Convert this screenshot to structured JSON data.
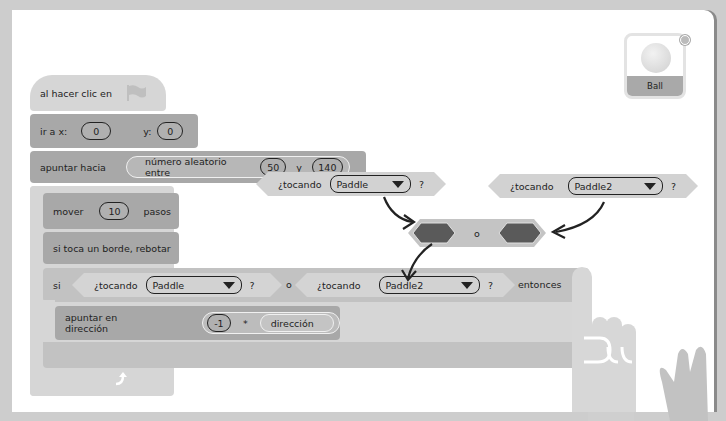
{
  "colors": {
    "panel_bg": "#ffffff",
    "frame_bg": "#cdcdcd",
    "motion_block": "#a8a8a8",
    "control_block": "#d6d6d6",
    "sensing_block": "#c9c9c9",
    "operator_slot": "#555555",
    "arrow": "#222222"
  },
  "script": {
    "hat": {
      "label": "al hacer clic en",
      "icon": "green-flag-icon"
    },
    "goto": {
      "label": "ir a x:",
      "x_value": "0",
      "y_label": "y:",
      "y_value": "0"
    },
    "point_towards": {
      "label": "apuntar hacia",
      "reporter_label": "número aleatorio entre",
      "from": "50",
      "and_label": "y",
      "to": "140"
    },
    "forever": {
      "label": "por siempre",
      "loop_icon": "loop-arrow-icon"
    },
    "move": {
      "label": "mover",
      "value": "10",
      "suffix": "pasos"
    },
    "bounce": {
      "label": "si toca un borde, rebotar"
    },
    "if_block": {
      "label": "si",
      "cond1_label": "¿tocando",
      "cond1_value": "Paddle",
      "cond1_q": "?",
      "or_label": "o",
      "cond2_label": "¿tocando",
      "cond2_value": "Paddle2",
      "cond2_q": "?",
      "then_label": "entonces"
    },
    "point_direction": {
      "label": "apuntar en dirección",
      "value": "-1",
      "operator": "*",
      "reporter": "dirección"
    }
  },
  "floating": {
    "touching1": {
      "label": "¿tocando",
      "value": "Paddle",
      "q": "?"
    },
    "touching2": {
      "label": "¿tocando",
      "value": "Paddle2",
      "q": "?"
    },
    "or_block": {
      "label": "o"
    }
  },
  "sprite": {
    "name": "Ball",
    "delete_icon": "close-icon"
  }
}
